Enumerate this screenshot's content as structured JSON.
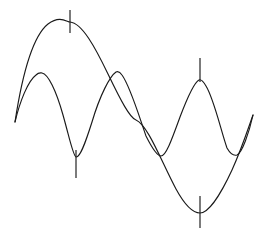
{
  "figure": {
    "background_color": "#ffffff",
    "stroke_color": "#1a1a1a",
    "stroke_width": 1.15,
    "width": 272,
    "height": 236
  },
  "chart_data": {
    "type": "line",
    "title": "",
    "subtitle": "",
    "xlabel": "",
    "ylabel": "",
    "xlim": [
      15,
      253
    ],
    "ylim": [
      236,
      0
    ],
    "grid": false,
    "axes_visible": false,
    "tick_labels_visible": false,
    "legend": false,
    "legend_position": "none",
    "series": [
      {
        "name": "fundamental-wave",
        "cycles": 1,
        "amplitude_px": 96,
        "stroke": "#1a1a1a",
        "path": "M 15,122 C 22,76 33,36 48,24 C 60,15 67,22 70,22 C 82,23 95,47 108,74 C 121,101 130,118 136,120 C 148,125 162,163 176,189 C 188,211 196,213 200,213 C 208,213 220,196 232,170 C 242,148 249,126 253,115",
        "points": [
          {
            "x": 15,
            "y": 122,
            "kind": "start"
          },
          {
            "x": 70,
            "y": 22,
            "kind": "maximum"
          },
          {
            "x": 136,
            "y": 120,
            "kind": "zero-crossing"
          },
          {
            "x": 200,
            "y": 213,
            "kind": "minimum"
          },
          {
            "x": 253,
            "y": 115,
            "kind": "end"
          }
        ]
      },
      {
        "name": "harmonic-wave",
        "cycles": 2,
        "amplitude_px": 45,
        "stroke": "#1a1a1a",
        "path": "M 15,122 C 20,101 28,81 36,75 C 39,72 41,73 42,73 C 48,74 56,90 63,115 C 69,136 73,156 76,157 C 80,158 85,144 92,122 C 100,95 110,76 116,72 C 118,71 120,72 122,75 C 130,86 138,113 146,136 C 154,152 158,156 161,156 C 166,156 172,139 180,117 C 188,96 195,82 199,80 C 201,79 203,81 206,86 C 214,99 221,131 227,148 C 231,155 234,156 237,155 C 242,153 249,133 253,115",
        "points": [
          {
            "x": 15,
            "y": 122,
            "kind": "start"
          },
          {
            "x": 42,
            "y": 73,
            "kind": "maximum"
          },
          {
            "x": 76,
            "y": 157,
            "kind": "minimum"
          },
          {
            "x": 117,
            "y": 72,
            "kind": "maximum"
          },
          {
            "x": 161,
            "y": 156,
            "kind": "minimum"
          },
          {
            "x": 200,
            "y": 80,
            "kind": "maximum"
          },
          {
            "x": 229,
            "y": 155,
            "kind": "minimum"
          },
          {
            "x": 253,
            "y": 115,
            "kind": "end"
          }
        ]
      }
    ],
    "annotations": [
      {
        "name": "tick-upper-left",
        "x": 70,
        "y1": 10,
        "y2": 33,
        "marks": "fundamental-wave maximum"
      },
      {
        "name": "tick-lower-left",
        "x": 76,
        "y1": 150,
        "y2": 178,
        "marks": "harmonic-wave minimum"
      },
      {
        "name": "tick-upper-right",
        "x": 200,
        "y1": 58,
        "y2": 82,
        "marks": "harmonic-wave maximum"
      },
      {
        "name": "tick-lower-right",
        "x": 200,
        "y1": 196,
        "y2": 228,
        "marks": "fundamental-wave minimum"
      }
    ]
  }
}
